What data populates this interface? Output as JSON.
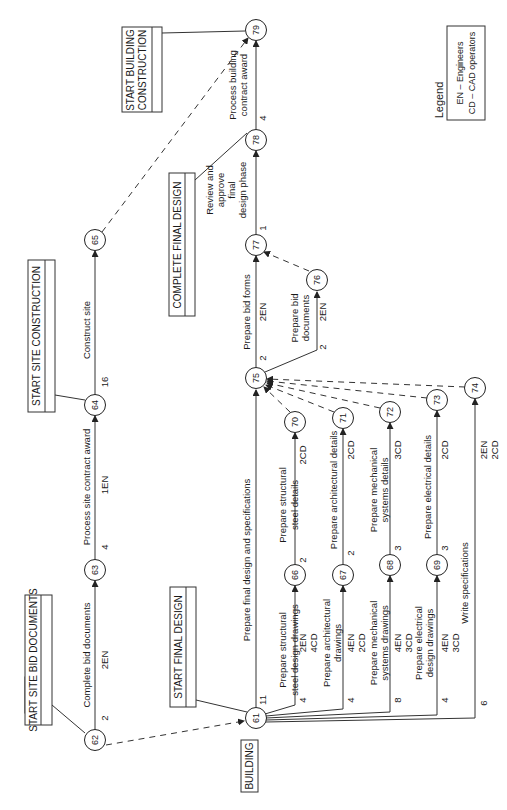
{
  "sections": {
    "site": "SITE",
    "building": "BUILDING"
  },
  "milestones": {
    "start_site_bid_documents": "START SITE BID DOCUMENTS",
    "start_site_construction": "START SITE CONSTRUCTION",
    "start_building_construction_1": "START BUILDING",
    "start_building_construction_2": "CONSTRUCTION",
    "complete_final_design": "COMPLETE FINAL DESIGN",
    "start_final_design": "START FINAL DESIGN"
  },
  "nodes": {
    "n61": "61",
    "n62": "62",
    "n63": "63",
    "n64": "64",
    "n65": "65",
    "n66": "66",
    "n67": "67",
    "n68": "68",
    "n69": "69",
    "n70": "70",
    "n71": "71",
    "n72": "72",
    "n73": "73",
    "n74": "74",
    "n75": "75",
    "n76": "76",
    "n77": "77",
    "n78": "78",
    "n79": "79"
  },
  "activities": {
    "a62_63": {
      "label": "Complete bid documents",
      "duration": "2",
      "resources": "2EN"
    },
    "a63_64": {
      "label": "Process site contract award",
      "duration": "4",
      "resources": "1EN"
    },
    "a64_65": {
      "label": "Construct site",
      "duration": "16"
    },
    "a61_75": {
      "label": "Prepare final design and specifications",
      "duration": "11"
    },
    "a61_66": {
      "label_1": "Prepare structural",
      "label_2": "steel design drawings",
      "duration": "4",
      "res_1": "2EN",
      "res_2": "4CD"
    },
    "a61_67": {
      "label_1": "Prepare architectural",
      "label_2": "drawings",
      "duration": "4",
      "res_1": "4EN",
      "res_2": "2CD"
    },
    "a61_68": {
      "label_1": "Prepare mechanical",
      "label_2": "systems drawings",
      "duration": "8",
      "res_1": "4EN",
      "res_2": "3CD"
    },
    "a61_69": {
      "label_1": "Prepare electrical",
      "label_2": "design drawings",
      "duration": "4",
      "res_1": "4EN",
      "res_2": "3CD"
    },
    "a61_74": {
      "label": "Write specifications",
      "duration": "6",
      "res_1": "2EN",
      "res_2": "2CD"
    },
    "a66_70": {
      "label_1": "Prepare structural",
      "label_2": "steel details",
      "duration": "2",
      "resources": "2CD"
    },
    "a67_71": {
      "label": "Prepare architectural details",
      "duration": "2",
      "resources": "2CD"
    },
    "a68_72": {
      "label_1": "Prepare mechanical",
      "label_2": "systems details",
      "duration": "3",
      "resources": "3CD"
    },
    "a69_73": {
      "label": "Prepare electrical details",
      "duration": "3",
      "resources": "2CD"
    },
    "a75_77": {
      "label": "Prepare bid forms",
      "duration": "2",
      "resources": "2EN"
    },
    "a75_76": {
      "label_1": "Prepare bid",
      "label_2": "documents",
      "duration": "2",
      "resources": "2EN"
    },
    "a77_78": {
      "label_1": "Review and",
      "label_2": "approve",
      "label_3": "final",
      "label_4": "design phase",
      "duration": "1"
    },
    "a78_79": {
      "label_1": "Process building",
      "label_2": "contract award",
      "duration": "4"
    }
  },
  "legend": {
    "title": "Legend",
    "items": [
      "EN – Engineers",
      "CD – CAD operators"
    ]
  }
}
